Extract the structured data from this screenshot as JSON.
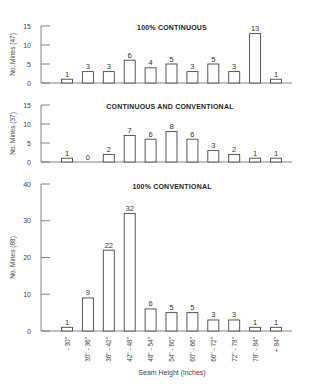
{
  "chart_data": [
    {
      "type": "bar",
      "title": "100% CONTINUOUS",
      "ylabel": "No. Mines (47)",
      "xlabel": "",
      "ylim": [
        0,
        15
      ],
      "yticks": [
        0,
        5,
        10,
        15
      ],
      "categories": [
        "- 30\"",
        "30\" - 36\"",
        "36\" - 42\"",
        "42\" - 48\"",
        "48\" - 54\"",
        "54\" - 60\"",
        "60\" - 66\"",
        "66\" - 72\"",
        "72\" - 78\"",
        "78\" - 84\"",
        "+ 84\""
      ],
      "values": [
        1,
        3,
        3,
        6,
        4,
        5,
        3,
        5,
        3,
        13,
        1
      ],
      "grid": false
    },
    {
      "type": "bar",
      "title": "CONTINUOUS AND CONVENTIONAL",
      "ylabel": "No. Mines (37)",
      "xlabel": "",
      "ylim": [
        0,
        15
      ],
      "yticks": [
        0,
        5,
        10,
        15
      ],
      "categories": [
        "- 30\"",
        "30\" - 36\"",
        "36\" - 42\"",
        "42\" - 48\"",
        "48\" - 54\"",
        "54\" - 60\"",
        "60\" - 66\"",
        "66\" - 72\"",
        "72\" - 78\"",
        "78\" - 84\"",
        "+ 84\""
      ],
      "values": [
        1,
        0,
        2,
        7,
        6,
        8,
        6,
        3,
        2,
        1,
        1
      ],
      "grid": false
    },
    {
      "type": "bar",
      "title": "100% CONVENTIONAL",
      "ylabel": "No. Mines (88)",
      "xlabel": "Seam Height (inches)",
      "ylim": [
        0,
        40
      ],
      "yticks": [
        0,
        10,
        20,
        30,
        40
      ],
      "categories": [
        "- 30\"",
        "30\" - 36\"",
        "36\" - 42\"",
        "42\" - 48\"",
        "48\" - 54\"",
        "54\" - 60\"",
        "60\" - 66\"",
        "66\" - 72\"",
        "72\" - 78\"",
        "78\" - 84\"",
        "+ 84\""
      ],
      "values": [
        1,
        9,
        22,
        32,
        6,
        5,
        5,
        3,
        3,
        1,
        1
      ],
      "grid": false
    }
  ],
  "layout": {
    "axis_x": 41,
    "axis_end_x": 292,
    "bar_first_center": 67,
    "bar_spacing": 20.9,
    "bar_width": 11,
    "panels": [
      {
        "y_top": 26,
        "y_base": 83
      },
      {
        "y_top": 105,
        "y_base": 162
      },
      {
        "y_top": 184,
        "y_base": 331
      }
    ],
    "colors": {
      "bar_fill": "#ffffff",
      "bar_stroke": "#444444",
      "axis": "#666666",
      "text": "#333333"
    }
  }
}
